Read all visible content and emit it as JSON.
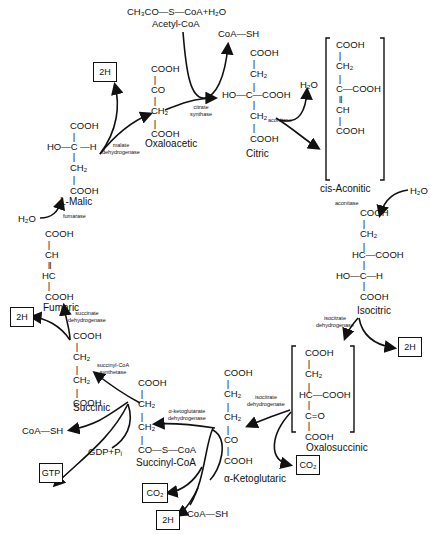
{
  "inputs": {
    "acetyl_formula": "CH₃CO—S—CoA+H₂O",
    "acetyl_name": "Acetyl-CoA",
    "coa_sh_top": "CoA—SH"
  },
  "compounds": {
    "oxaloacetic": {
      "name": "Oxaloacetic",
      "lines": [
        "COOH",
        "|",
        "CO",
        "|",
        "CH₂",
        "|",
        "COOH"
      ]
    },
    "citric": {
      "name": "Citric",
      "lines": [
        "COOH",
        "|",
        "CH₂",
        "|",
        "HO—C—COOH",
        "|",
        "CH₂",
        "|",
        "COOH"
      ]
    },
    "cis_aconitic": {
      "name": "cis-Aconitic",
      "lines": [
        "COOH",
        "|",
        "CH₂",
        "|",
        "C—COOH",
        "‖",
        "CH",
        "|",
        "COOH"
      ]
    },
    "isocitric": {
      "name": "Isocitric",
      "lines": [
        "COOH",
        "|",
        "CH₂",
        "|",
        "HC—COOH",
        "|",
        "HO—C—H",
        "|",
        "COOH"
      ]
    },
    "oxalosuccinic": {
      "name": "Oxalosuccinic",
      "lines": [
        "COOH",
        "|",
        "CH₂",
        "|",
        "HC—COOH",
        "|",
        "C=O",
        "|",
        "COOH"
      ]
    },
    "alpha_ketoglutaric": {
      "name": "α-Ketoglutaric",
      "lines": [
        "COOH",
        "|",
        "CH₂",
        "|",
        "CH₂",
        "|",
        "CO",
        "|",
        "COOH"
      ]
    },
    "succinyl_coa": {
      "name": "Succinyl-CoA",
      "lines": [
        "COOH",
        "|",
        "CH₂",
        "|",
        "CH₂",
        "|",
        "CO—S—CoA"
      ]
    },
    "succinic": {
      "name": "Succinic",
      "lines": [
        "COOH",
        "|",
        "CH₂",
        "|",
        "CH₂",
        "|",
        "COOH"
      ]
    },
    "fumaric": {
      "name": "Fumaric",
      "lines": [
        "COOH",
        "|",
        "CH",
        "‖",
        "HC",
        "|",
        "COOH"
      ]
    },
    "l_malic": {
      "name": "L-Malic",
      "lines": [
        "COOH",
        "|",
        "HO—C—H",
        "|",
        "CH₂",
        "|",
        "COOH"
      ]
    }
  },
  "enzymes": {
    "citrate_synthase": "citrate\nsynthase",
    "aconitase_1": "aconitase",
    "aconitase_2": "aconitase",
    "isocitrate_dh_1": "isocitrate\ndehydrogenase",
    "isocitrate_dh_2": "isocitrate\ndehydrogenase",
    "akg_dh": "α-ketoglutarate\ndehydrogenase",
    "succinyl_coa_synthetase": "succinyl-CoA\nsynthetase",
    "succinate_dh": "succinate\ndehydrogenase",
    "fumarase": "fumarase",
    "malate_dh": "malate\ndehydrogenase"
  },
  "side_species": {
    "h2o_aconitase_out": "H₂O",
    "h2o_aconitase_in": "H₂O",
    "h2o_fumarase": "H₂O",
    "coa_sh_akg": "CoA—SH",
    "coa_sh_succinyl": "CoA—SH",
    "gdp_pi": "GDP+Pᵢ"
  },
  "boxes": {
    "malate_2h": "2H",
    "isocitrate_2h": "2H",
    "oxalosuccinic_co2": "CO₂",
    "akg_co2": "CO₂",
    "akg_2h": "2H",
    "succinate_2h": "2H",
    "gtp": "GTP"
  }
}
